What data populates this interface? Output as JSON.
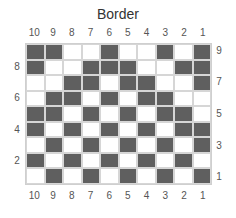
{
  "title": "Border",
  "column_labels": [
    "10",
    "9",
    "8",
    "7",
    "6",
    "5",
    "4",
    "3",
    "2",
    "1"
  ],
  "row_labels_left": [
    {
      "label": "8",
      "row": 8
    },
    {
      "label": "6",
      "row": 6
    },
    {
      "label": "4",
      "row": 4
    },
    {
      "label": "2",
      "row": 2
    }
  ],
  "row_labels_right": [
    {
      "label": "9",
      "row": 9
    },
    {
      "label": "7",
      "row": 7
    },
    {
      "label": "5",
      "row": 5
    },
    {
      "label": "3",
      "row": 3
    },
    {
      "label": "1",
      "row": 1
    }
  ],
  "colors": {
    "filled": "#5f5f5f",
    "empty": "#ffffff",
    "gridline": "#d6d6d6"
  },
  "rows_top_to_bottom": [
    {
      "row": 9,
      "cells": [
        1,
        1,
        0,
        0,
        1,
        0,
        0,
        1,
        0,
        1
      ]
    },
    {
      "row": 8,
      "cells": [
        1,
        0,
        0,
        1,
        1,
        1,
        0,
        0,
        1,
        1
      ]
    },
    {
      "row": 7,
      "cells": [
        0,
        0,
        1,
        1,
        0,
        1,
        1,
        0,
        0,
        1
      ]
    },
    {
      "row": 6,
      "cells": [
        0,
        1,
        1,
        0,
        1,
        0,
        1,
        1,
        0,
        0
      ]
    },
    {
      "row": 5,
      "cells": [
        1,
        1,
        0,
        1,
        0,
        1,
        0,
        1,
        1,
        0
      ]
    },
    {
      "row": 4,
      "cells": [
        1,
        0,
        1,
        0,
        1,
        0,
        1,
        0,
        1,
        1
      ]
    },
    {
      "row": 3,
      "cells": [
        0,
        1,
        0,
        1,
        0,
        1,
        0,
        1,
        0,
        1
      ]
    },
    {
      "row": 2,
      "cells": [
        1,
        0,
        1,
        0,
        1,
        0,
        1,
        0,
        1,
        0
      ]
    },
    {
      "row": 1,
      "cells": [
        0,
        1,
        0,
        1,
        0,
        1,
        0,
        1,
        0,
        1
      ]
    }
  ]
}
